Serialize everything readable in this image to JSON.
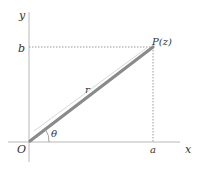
{
  "diagram": {
    "type": "complex-plane-polar-form",
    "labels": {
      "x_axis": "x",
      "y_axis": "y",
      "origin": "O",
      "point": "P(z)",
      "real_part": "a",
      "imag_part": "b",
      "modulus": "r",
      "argument": "θ"
    },
    "colors": {
      "axis": "#b8b8b8",
      "radius_line": "#8a8a8a",
      "measure_line": "#d8d8d8",
      "dotted_guides": "#9a9a9a",
      "text": "#333333"
    }
  }
}
